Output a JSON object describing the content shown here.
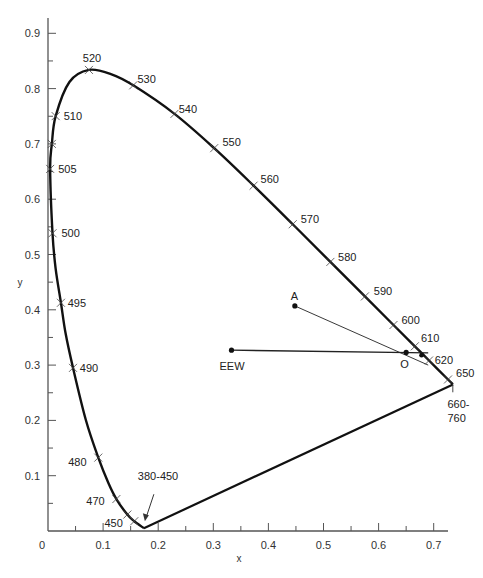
{
  "chart_data": {
    "type": "line",
    "title": "",
    "xlabel": "x",
    "ylabel": "y",
    "xlim": [
      0,
      0.73
    ],
    "ylim": [
      0,
      0.92
    ],
    "grid": false,
    "x_ticks": [
      0,
      0.1,
      0.2,
      0.3,
      0.4,
      0.5,
      0.6,
      0.7
    ],
    "x_tick_labels": [
      "0",
      "0.1",
      "0.2",
      "0.3",
      "0.4",
      "0.5",
      "0.6",
      "0.7"
    ],
    "y_ticks": [
      0.1,
      0.2,
      0.3,
      0.4,
      0.5,
      0.6,
      0.7,
      0.8,
      0.9
    ],
    "y_tick_labels": [
      "0.1",
      "0.2",
      "0.3",
      "0.4",
      "0.5",
      "0.6",
      "0.7",
      "0.8",
      "0.9"
    ],
    "spectral_locus": [
      {
        "label": "380-450",
        "x": 0.1741,
        "y": 0.005
      },
      {
        "label": "450",
        "x": 0.1566,
        "y": 0.0177
      },
      {
        "label": "",
        "x": 0.151,
        "y": 0.0228
      },
      {
        "label": "",
        "x": 0.144,
        "y": 0.0297
      },
      {
        "label": "470",
        "x": 0.1241,
        "y": 0.0578
      },
      {
        "label": "",
        "x": 0.1096,
        "y": 0.0868
      },
      {
        "label": "480",
        "x": 0.0913,
        "y": 0.1327
      },
      {
        "label": "",
        "x": 0.0687,
        "y": 0.2007
      },
      {
        "label": "490",
        "x": 0.0454,
        "y": 0.295
      },
      {
        "label": "",
        "x": 0.0235,
        "y": 0.4127
      },
      {
        "label": "495",
        "x": 0.0235,
        "y": 0.4127
      },
      {
        "label": "",
        "x": 0.0082,
        "y": 0.5384
      },
      {
        "label": "500",
        "x": 0.0082,
        "y": 0.5384
      },
      {
        "label": "505",
        "x": 0.0039,
        "y": 0.6548
      },
      {
        "label": "510",
        "x": 0.0139,
        "y": 0.7502
      },
      {
        "label": "",
        "x": 0.0389,
        "y": 0.812
      },
      {
        "label": "520",
        "x": 0.0743,
        "y": 0.8338
      },
      {
        "label": "",
        "x": 0.1142,
        "y": 0.8262
      },
      {
        "label": "530",
        "x": 0.1547,
        "y": 0.8059
      },
      {
        "label": "540",
        "x": 0.2296,
        "y": 0.7543
      },
      {
        "label": "550",
        "x": 0.3016,
        "y": 0.6923
      },
      {
        "label": "560",
        "x": 0.3731,
        "y": 0.6245
      },
      {
        "label": "570",
        "x": 0.4441,
        "y": 0.5547
      },
      {
        "label": "580",
        "x": 0.5125,
        "y": 0.4866
      },
      {
        "label": "590",
        "x": 0.5752,
        "y": 0.4242
      },
      {
        "label": "600",
        "x": 0.627,
        "y": 0.3725
      },
      {
        "label": "610",
        "x": 0.6658,
        "y": 0.334
      },
      {
        "label": "620",
        "x": 0.6915,
        "y": 0.3083
      },
      {
        "label": "650",
        "x": 0.726,
        "y": 0.274
      },
      {
        "label": "660-760",
        "x": 0.7347,
        "y": 0.2653
      }
    ],
    "wavelength_labels": [
      {
        "text": "520",
        "x": 0.085,
        "y": 0.837,
        "dx": -12,
        "dy": -6
      },
      {
        "text": "530",
        "x": 0.155,
        "y": 0.806,
        "dx": 4,
        "dy": -2
      },
      {
        "text": "540",
        "x": 0.23,
        "y": 0.754,
        "dx": 4,
        "dy": -1
      },
      {
        "text": "550",
        "x": 0.302,
        "y": 0.692,
        "dx": 8,
        "dy": -2
      },
      {
        "text": "560",
        "x": 0.373,
        "y": 0.625,
        "dx": 7,
        "dy": -2
      },
      {
        "text": "570",
        "x": 0.444,
        "y": 0.555,
        "dx": 8,
        "dy": -1
      },
      {
        "text": "580",
        "x": 0.512,
        "y": 0.487,
        "dx": 8,
        "dy": -1
      },
      {
        "text": "590",
        "x": 0.575,
        "y": 0.424,
        "dx": 9,
        "dy": -2
      },
      {
        "text": "600",
        "x": 0.627,
        "y": 0.372,
        "dx": 8,
        "dy": -1
      },
      {
        "text": "610",
        "x": 0.666,
        "y": 0.334,
        "dx": 6,
        "dy": -4
      },
      {
        "text": "620",
        "x": 0.691,
        "y": 0.308,
        "dx": 6,
        "dy": 3
      },
      {
        "text": "650",
        "x": 0.726,
        "y": 0.274,
        "dx": 8,
        "dy": -2
      },
      {
        "text": "660-",
        "x": 0.734,
        "y": 0.265,
        "dx": -5,
        "dy": 24
      },
      {
        "text": "760",
        "x": 0.734,
        "y": 0.265,
        "dx": -5,
        "dy": 38
      },
      {
        "text": "510",
        "x": 0.014,
        "y": 0.75,
        "dx": 8,
        "dy": 4
      },
      {
        "text": "505",
        "x": 0.004,
        "y": 0.655,
        "dx": 8,
        "dy": 4
      },
      {
        "text": "500",
        "x": 0.008,
        "y": 0.538,
        "dx": 9,
        "dy": 4
      },
      {
        "text": "495",
        "x": 0.023,
        "y": 0.413,
        "dx": 7,
        "dy": 4
      },
      {
        "text": "490",
        "x": 0.045,
        "y": 0.295,
        "dx": 7,
        "dy": 4
      },
      {
        "text": "480",
        "x": 0.091,
        "y": 0.133,
        "dx": -30,
        "dy": 9
      },
      {
        "text": "470",
        "x": 0.124,
        "y": 0.058,
        "dx": -30,
        "dy": 6
      },
      {
        "text": "450",
        "x": 0.157,
        "y": 0.018,
        "dx": -30,
        "dy": 6
      },
      {
        "text": "380-450",
        "x": 0.174,
        "y": 0.005,
        "dx": -6,
        "dy": -48
      }
    ],
    "purple_line": {
      "from": [
        0.174,
        0.005
      ],
      "to": [
        0.735,
        0.265
      ]
    },
    "points": [
      {
        "label": "EEW",
        "x": 0.333,
        "y": 0.327
      },
      {
        "label": "A",
        "x": 0.448,
        "y": 0.407
      },
      {
        "label": "O",
        "x": 0.65,
        "y": 0.323
      }
    ],
    "lines": [
      {
        "from": "EEW",
        "to_xy": [
          0.69,
          0.322
        ]
      },
      {
        "from": "A",
        "to_xy": [
          0.69,
          0.3
        ]
      }
    ]
  },
  "labels": {
    "x_axis_title": "x",
    "y_axis_title": "y",
    "point_eew": "EEW",
    "point_a": "A",
    "point_o": "O"
  }
}
